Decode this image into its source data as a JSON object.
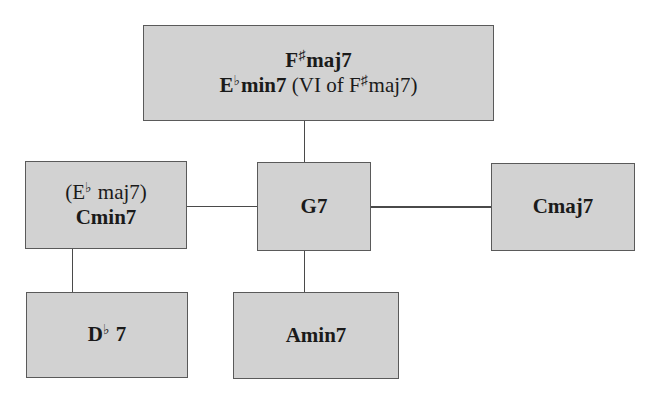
{
  "diagram": {
    "type": "chord-relationship-tree",
    "colors": {
      "node_fill": "#d2d2d2",
      "node_border": "#5a5a5a",
      "edge": "#4a4a4a",
      "background": "#ffffff"
    },
    "nodes": {
      "top": {
        "line1": {
          "root": "F",
          "accidental": "♯",
          "quality": "maj7"
        },
        "line2": {
          "root": "E",
          "accidental": "♭",
          "quality": "min7",
          "note_prefix": "(VI of F",
          "note_accidental": "♯",
          "note_suffix": "maj7)"
        }
      },
      "cmin7": {
        "line1": {
          "open": "(E",
          "accidental": "♭",
          "rest": " maj7)"
        },
        "line2": "Cmin7"
      },
      "g7": {
        "label": "G7"
      },
      "cmaj7": {
        "label": "Cmaj7"
      },
      "db7": {
        "root": "D",
        "accidental": "♭",
        "quality": " 7"
      },
      "amin7": {
        "label": "Amin7"
      }
    },
    "edges": [
      {
        "from": "top",
        "to": "g7"
      },
      {
        "from": "cmin7",
        "to": "g7"
      },
      {
        "from": "g7",
        "to": "cmaj7"
      },
      {
        "from": "cmin7",
        "to": "db7"
      },
      {
        "from": "g7",
        "to": "amin7"
      }
    ]
  }
}
